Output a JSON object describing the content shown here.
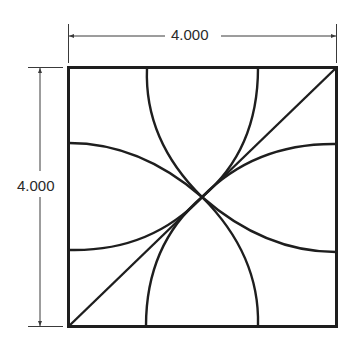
{
  "drawing": {
    "dimensions": {
      "width_label": "4.000",
      "height_label": "4.000"
    },
    "colors": {
      "line": "#1e1e1e",
      "dimension_line": "#3a3a3a",
      "background": "#ffffff"
    }
  }
}
